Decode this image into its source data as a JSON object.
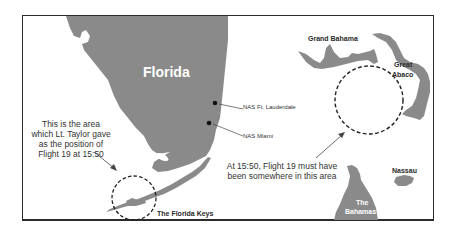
{
  "map": {
    "colors": {
      "land": "#8a8a8a",
      "frame": "#2b2b2b",
      "background": "#ffffff",
      "text": "#333333"
    },
    "regions": {
      "florida": "Florida",
      "florida_keys": "The Florida Keys",
      "grand_bahama": "Grand Bahama",
      "great_abaco_line1": "Great",
      "great_abaco_line2": "Abaco",
      "nassau": "Nassau",
      "bahamas_line1": "The",
      "bahamas_line2": "Bahamas"
    },
    "markers": [
      {
        "label": "NAS Ft. Lauderdale"
      },
      {
        "label": "NAS Miami"
      }
    ],
    "annotations": {
      "taylor_area": "This is the area which Lt. Taylor gave as the position of Flight 19 at 15:50",
      "actual_area": "At 15:50, Flight 19 must have been somewhere in this area"
    }
  }
}
